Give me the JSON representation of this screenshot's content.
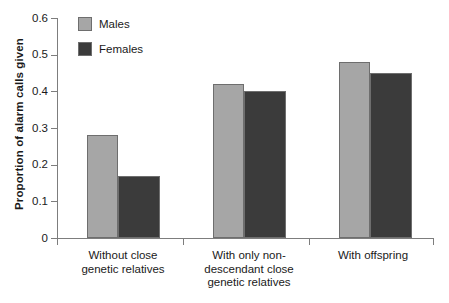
{
  "chart_data": {
    "type": "bar",
    "title": "",
    "xlabel": "",
    "ylabel": "Proportion of alarm calls given",
    "ylim": [
      0,
      0.6
    ],
    "ytick_labels": [
      "0",
      "0.1",
      "0.2",
      "0.3",
      "0.4",
      "0.5",
      "0.6"
    ],
    "ytick_values": [
      0,
      0.1,
      0.2,
      0.3,
      0.4,
      0.5,
      0.6
    ],
    "grid": false,
    "legend_position": "top-left-inside",
    "categories": [
      "Without close\ngenetic relatives",
      "With only non-\ndescendant close\ngenetic relatives",
      "With offspring"
    ],
    "category_lines": [
      [
        "Without close",
        "genetic relatives"
      ],
      [
        "With only non-",
        "descendant close",
        "genetic relatives"
      ],
      [
        "With offspring"
      ]
    ],
    "series": [
      {
        "name": "Males",
        "color": "#a6a6a6",
        "values": [
          0.28,
          0.42,
          0.48
        ]
      },
      {
        "name": "Females",
        "color": "#3b3b3b",
        "values": [
          0.17,
          0.4,
          0.45
        ]
      }
    ]
  },
  "legend": {
    "items": [
      {
        "label": "Males",
        "color": "#a6a6a6"
      },
      {
        "label": "Females",
        "color": "#3b3b3b"
      }
    ]
  },
  "axis": {
    "y_title": "Proportion of alarm calls given"
  }
}
